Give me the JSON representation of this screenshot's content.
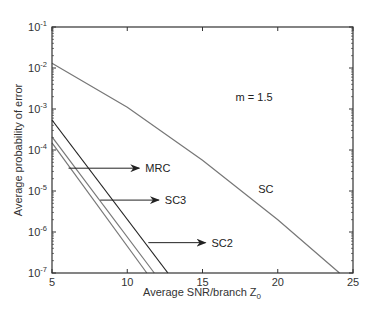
{
  "chart_data": {
    "type": "line",
    "title": "",
    "xlabel": "Average SNR/branch Z",
    "xlabel_subscript": "0",
    "ylabel": "Average probability of error",
    "xlim": [
      5,
      25
    ],
    "ylim": [
      1e-07,
      0.1
    ],
    "yscale": "log",
    "x_ticks": [
      5,
      10,
      15,
      20,
      25
    ],
    "y_ticks": [
      {
        "base": "10",
        "exp": "-1",
        "value": 0.1
      },
      {
        "base": "10",
        "exp": "-2",
        "value": 0.01
      },
      {
        "base": "10",
        "exp": "-3",
        "value": 0.001
      },
      {
        "base": "10",
        "exp": "-4",
        "value": 0.0001
      },
      {
        "base": "10",
        "exp": "-5",
        "value": 1e-05
      },
      {
        "base": "10",
        "exp": "-6",
        "value": 1e-06
      },
      {
        "base": "10",
        "exp": "-7",
        "value": 1e-07
      }
    ],
    "grid": false,
    "legend": "none (arrow annotations)",
    "series": [
      {
        "name": "SC",
        "color": "#777777",
        "x": [
          5,
          10,
          15,
          20,
          24.1
        ],
        "y": [
          0.013,
          0.0011,
          5.6e-05,
          2e-06,
          1e-07
        ]
      },
      {
        "name": "SC2",
        "color": "#222222",
        "x": [
          5,
          12.7
        ],
        "y": [
          0.00054,
          1e-07
        ]
      },
      {
        "name": "SC3",
        "color": "#777777",
        "x": [
          5,
          11.8
        ],
        "y": [
          0.00021,
          1e-07
        ]
      },
      {
        "name": "MRC",
        "color": "#777777",
        "x": [
          5,
          11.3
        ],
        "y": [
          0.00015,
          1e-07
        ]
      }
    ],
    "annotations": [
      {
        "text": "m = 1.5",
        "x": 17.2,
        "y": 0.0016
      },
      {
        "text": "SC",
        "x": 18.7,
        "y": 9e-06
      },
      {
        "text": "MRC",
        "arrow_from": [
          6.1,
          3.6e-05
        ],
        "arrow_to": [
          10.8,
          3.6e-05
        ]
      },
      {
        "text": "SC3",
        "arrow_from": [
          8.2,
          6e-06
        ],
        "arrow_to": [
          12.1,
          6e-06
        ]
      },
      {
        "text": "SC2",
        "arrow_from": [
          11.4,
          5.5e-07
        ],
        "arrow_to": [
          15.2,
          5.5e-07
        ]
      }
    ]
  }
}
